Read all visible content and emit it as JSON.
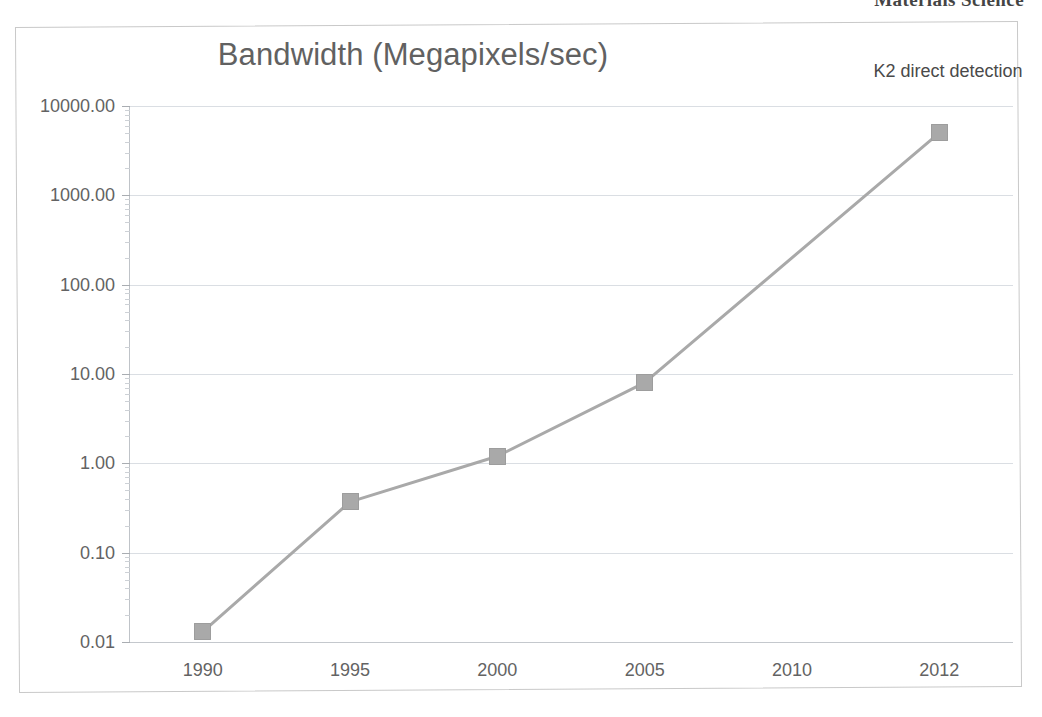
{
  "page": {
    "header_fragment": "Materials Science"
  },
  "chart_data": {
    "type": "line",
    "title": "Bandwidth (Megapixels/sec)",
    "xlabel": "",
    "ylabel": "",
    "yscale": "log",
    "ylim": [
      0.01,
      10000
    ],
    "grid": true,
    "legend": false,
    "categories": [
      "1990",
      "1995",
      "2000",
      "2005",
      "2010",
      "2012"
    ],
    "ytick_labels": [
      "10000.00",
      "1000.00",
      "100.00",
      "10.00",
      "1.00",
      "0.10",
      "0.01"
    ],
    "ytick_values": [
      10000,
      1000,
      100,
      10,
      1,
      0.1,
      0.01
    ],
    "series": [
      {
        "name": "Bandwidth",
        "color": "#a9a9a9",
        "values": [
          0.013,
          0.37,
          1.2,
          8.0,
          null,
          5000
        ],
        "markers": [
          true,
          true,
          true,
          true,
          false,
          true
        ]
      }
    ],
    "annotations": [
      {
        "text": "K2 direct detection",
        "target_category": "2012"
      }
    ]
  }
}
